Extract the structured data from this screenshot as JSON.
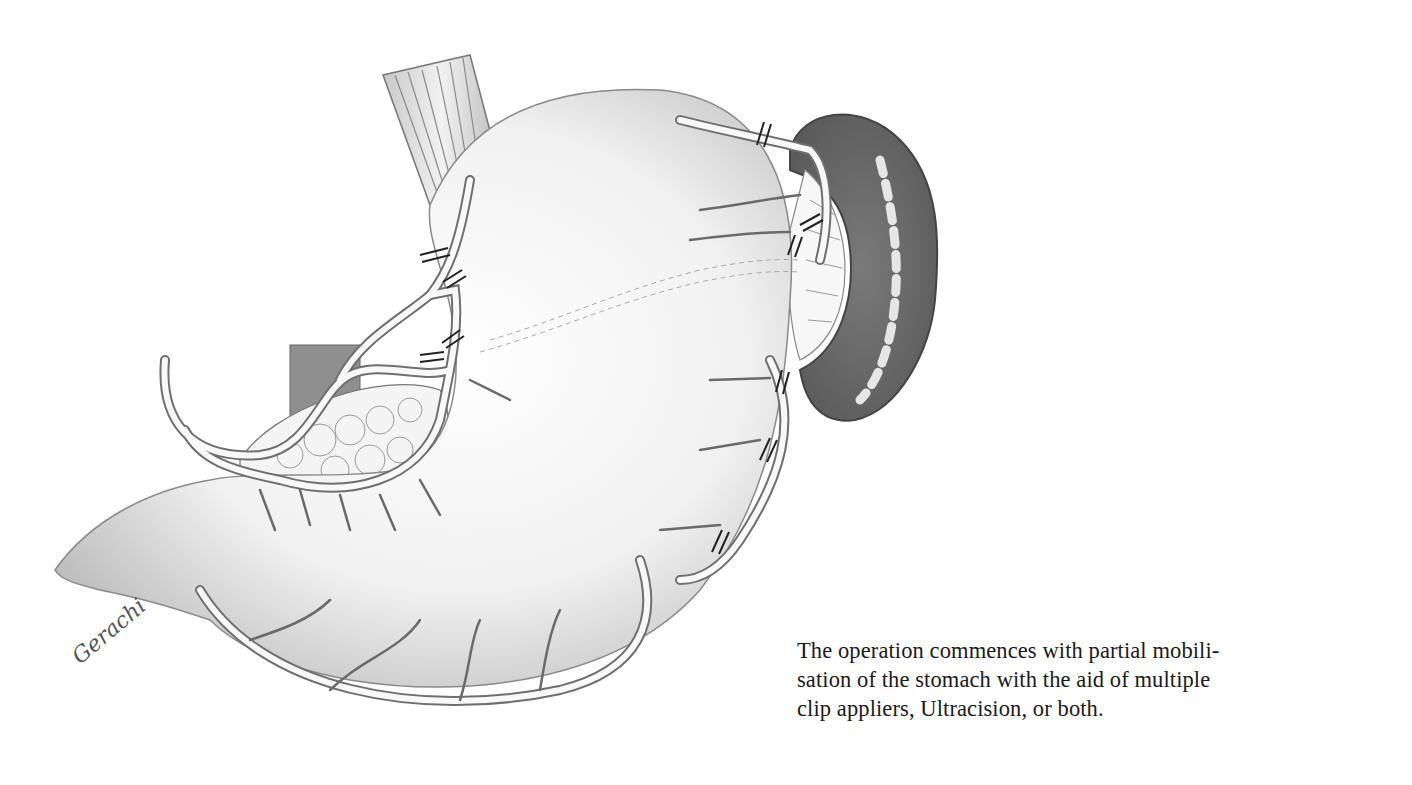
{
  "figure": {
    "signature": "Gerachi",
    "clip_marks_count": 11
  },
  "caption": {
    "lines": [
      "The operation commences with partial mobili-",
      "sation of the stomach with the aid of multiple",
      "clip appliers, Ultracision, or both."
    ]
  }
}
